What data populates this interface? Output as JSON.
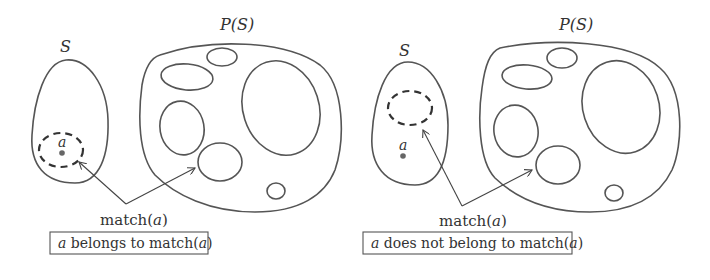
{
  "panels": [
    {
      "id": "left",
      "set_label": "S",
      "powerset_label": "P(S)",
      "element_label": "a",
      "arrow_label": "match(a)",
      "caption": {
        "prefix": "a",
        "text": " belongs to match(",
        "var": "a",
        "suffix": ")"
      },
      "caption_full": "a belongs to match(a)"
    },
    {
      "id": "right",
      "set_label": "S",
      "powerset_label": "P(S)",
      "element_label": "a",
      "arrow_label": "match(a)",
      "caption": {
        "prefix": "a",
        "text": " does not belong to match(",
        "var": "a",
        "suffix": ")"
      },
      "caption_full": "a does not belong to match(a)"
    }
  ],
  "arrow_word": "match(",
  "arrow_var": "a",
  "arrow_close": ")"
}
